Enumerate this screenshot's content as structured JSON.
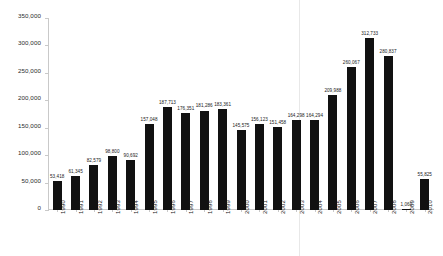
{
  "chart_data": {
    "type": "bar",
    "title": "",
    "subtitle": "",
    "xlabel": "",
    "ylabel": "",
    "ylim": [
      0,
      350000
    ],
    "grid": false,
    "legend": null,
    "y_ticks": [
      0,
      50000,
      100000,
      150000,
      200000,
      250000,
      300000,
      350000
    ],
    "y_tick_labels": [
      "0",
      "50,000",
      "100,000",
      "150,000",
      "200,000",
      "250,000",
      "300,000",
      "350,000"
    ],
    "categories": [
      "1990",
      "1991",
      "1992",
      "1993",
      "1994",
      "1995",
      "1996",
      "1997",
      "1998",
      "1999",
      "2000",
      "2001",
      "2002",
      "2003",
      "2004",
      "2005",
      "2006",
      "2007",
      "2008",
      "2009",
      "2010"
    ],
    "values": [
      53418,
      61345,
      82579,
      98800,
      90692,
      157048,
      187713,
      176351,
      181286,
      183361,
      145575,
      156123,
      151458,
      164298,
      164294,
      209988,
      260067,
      312733,
      280837,
      1060,
      55825
    ],
    "value_labels": [
      "53,418",
      "61,345",
      "82,579",
      "98,800",
      "90,692",
      "157,048",
      "187,713",
      "176,351",
      "181,286",
      "183,361",
      "145,575",
      "156,123",
      "151,458",
      "164,298",
      "164,294",
      "209,988",
      "260,067",
      "312,733",
      "280,837",
      "1,060",
      "55,825"
    ],
    "bar_color": "#111111",
    "axis_color": "#c9c9c9",
    "background_color": "#ffffff"
  }
}
